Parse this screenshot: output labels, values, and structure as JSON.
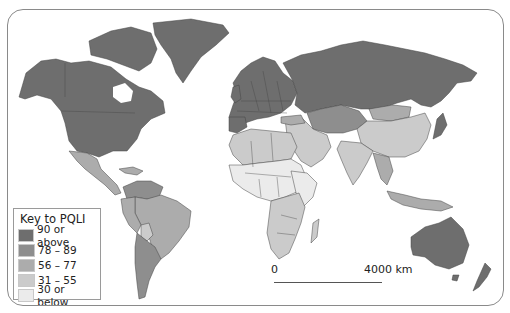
{
  "legend": {
    "title": "Key to PQLI",
    "items": [
      {
        "label": "90 or above",
        "color": "#6e6e6e"
      },
      {
        "label": "78 – 89",
        "color": "#8e8e8e"
      },
      {
        "label": "56 – 77",
        "color": "#acacac"
      },
      {
        "label": "31 – 55",
        "color": "#cbcbcb"
      },
      {
        "label": "30 or below",
        "color": "#ebebeb"
      }
    ]
  },
  "scale_bar": {
    "start_label": "0",
    "end_label": "4000 km"
  },
  "map": {
    "subject": "World map of Physical Quality of Life Index (PQLI) by country",
    "border_color": "#444444",
    "ocean_color": "#ffffff"
  }
}
